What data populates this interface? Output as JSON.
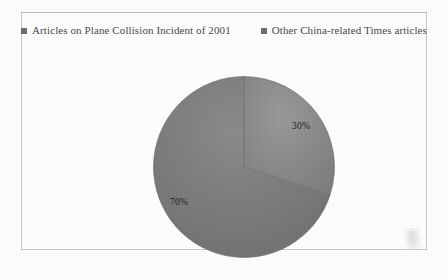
{
  "figure": {
    "frame_color": "#c9c9c9",
    "background": "#ffffff"
  },
  "legend": {
    "position": "top",
    "items": [
      {
        "label": "Articles on Plane Collision Incident of 2001",
        "marker": "square-marker-icon",
        "color": "#6e6e6e"
      },
      {
        "label": "Other China-related Times articles",
        "marker": "square-marker-icon",
        "color": "#6e6e6e"
      }
    ]
  },
  "chart_data": {
    "type": "pie",
    "title": "",
    "subtitle": "",
    "xlabel": "",
    "ylabel": "",
    "legend_position": "top",
    "grid": false,
    "start_angle_deg": 0,
    "direction": "clockwise",
    "categories": [
      "Articles on Plane Collision Incident of 2001",
      "Other China-related Times articles"
    ],
    "values": [
      30,
      70
    ],
    "data_labels": [
      "30%",
      "70%"
    ],
    "colors": [
      "#8d8d8d",
      "#7c7c7c"
    ],
    "slices": [
      {
        "name": "Articles on Plane Collision Incident of 2001",
        "value": 30,
        "label": "30%",
        "color": "#8d8d8d",
        "start_deg": 0,
        "end_deg": 108
      },
      {
        "name": "Other China-related Times articles",
        "value": 70,
        "label": "70%",
        "color": "#7c7c7c",
        "start_deg": 108,
        "end_deg": 360
      }
    ]
  }
}
